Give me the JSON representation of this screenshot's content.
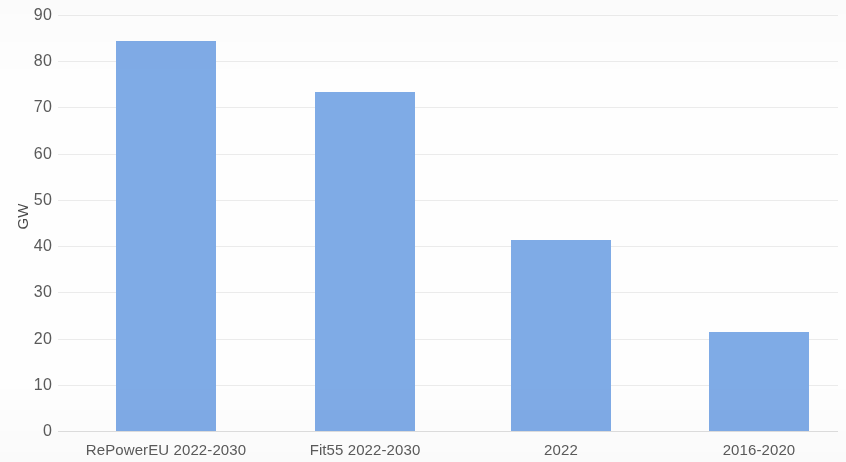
{
  "chart_data": {
    "type": "bar",
    "title": "",
    "subtitle": "",
    "xlabel": "",
    "ylabel": "GW",
    "categories": [
      "RePowerEU 2022-2030",
      "Fit55 2022-2030",
      "2022",
      "2016-2020"
    ],
    "values": [
      84.4,
      73.3,
      41.3,
      21.4
    ],
    "series": [
      {
        "name": "Annual solar capacity additions",
        "values": [
          84.4,
          73.3,
          41.3,
          21.4
        ]
      }
    ],
    "ylim": [
      0,
      90
    ],
    "ytick_labels": [
      "0",
      "10",
      "20",
      "30",
      "40",
      "50",
      "60",
      "70",
      "80",
      "90"
    ],
    "ytick_values": [
      0,
      10,
      20,
      30,
      40,
      50,
      60,
      70,
      80,
      90
    ],
    "grid": true,
    "grid_axis": "y",
    "legend": false,
    "legend_position": "none",
    "bar_color": "#7fabe6",
    "gridline_color": "#e8e8e8",
    "text_color": "#5a5a5a",
    "background_color": "#fefefe"
  },
  "axes": {
    "y_title": "GW"
  }
}
